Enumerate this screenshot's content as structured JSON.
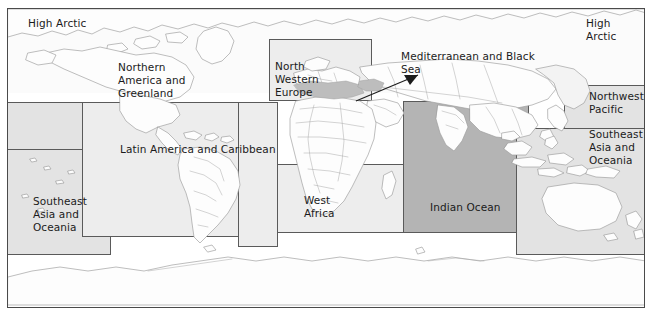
{
  "figure": {
    "kind": "world-regions-map",
    "width": 653,
    "height": 316,
    "frame": {
      "x": 7,
      "y": 8,
      "w": 638,
      "h": 300,
      "border_color": "#4a4a4a"
    }
  },
  "palette": {
    "background": "#ffffff",
    "frame_border": "#4a4a4a",
    "region_border": "#5a5a5a",
    "coastline": "#8d8d8d",
    "country_border": "#a9a9a9",
    "label_text": "#1b1b1b",
    "shade_near_white": "#fbfbfb",
    "shade_light": "#ededed",
    "shade_light_mid": "#e3e3e3",
    "shade_mid": "#c9c9c9",
    "shade_dark_mid": "#b4b4b4"
  },
  "regions": [
    {
      "id": "high-arctic",
      "label": "High Arctic",
      "label_lines": "High Arctic",
      "shade": "shade-0",
      "box": {
        "x": 0,
        "y": 0,
        "w": 637,
        "h": 84
      },
      "label_pos": {
        "x": 22,
        "y": 8
      },
      "note": "polar band spanning the entire top of the map"
    },
    {
      "id": "high-arctic-right-label",
      "label": "High Arctic",
      "label_lines": "High Arctic",
      "label_pos": {
        "x": 578,
        "y": 8
      },
      "label_only": true
    },
    {
      "id": "northern-america-and-greenland",
      "label": "Northern America and Greenland",
      "label_lines": "Northern\nAmerica and\nGreenland",
      "shade": "shade-0",
      "box": {
        "x": 73,
        "y": 84,
        "w": 195,
        "h": 10
      },
      "label_pos": {
        "x": 110,
        "y": 52
      }
    },
    {
      "id": "north-western-europe",
      "label": "North Western Europe",
      "label_lines": "North\nWestern\nEurope",
      "shade": "shade-1",
      "box": {
        "x": 261,
        "y": 30,
        "w": 103,
        "h": 62
      },
      "label_pos": {
        "x": 269,
        "y": 52
      }
    },
    {
      "id": "mediterranean-and-black-sea",
      "label": "Mediterranean and Black Sea",
      "label_lines": "Mediterranean and Black\nSea",
      "shade": "shade-3",
      "label_pos": {
        "x": 393,
        "y": 43
      },
      "arrow": {
        "from": {
          "x": 418,
          "y": 72
        },
        "to": {
          "x": 355,
          "y": 92
        }
      }
    },
    {
      "id": "northwest-pacific",
      "label": "Northwest Pacific",
      "label_lines": "Northwest\nPacific",
      "shade": "shade-2",
      "box": {
        "x": 556,
        "y": 76,
        "w": 81,
        "h": 44
      },
      "label_pos": {
        "x": 582,
        "y": 85
      }
    },
    {
      "id": "southeast-asia-and-oceania-east",
      "label": "Southeast Asia and Oceania",
      "label_lines": "Southeast\nAsia and\nOceania",
      "shade": "shade-2",
      "box": {
        "x": 508,
        "y": 120,
        "w": 129,
        "h": 126
      },
      "label_pos": {
        "x": 582,
        "y": 120
      }
    },
    {
      "id": "southeast-asia-and-oceania-west",
      "label": "Southeast Asia and Oceania",
      "label_lines": "Southeast\nAsia and\nOceania",
      "shade": "shade-2",
      "box": {
        "x": 0,
        "y": 93,
        "w": 103,
        "h": 153
      },
      "label_pos": {
        "x": 26,
        "y": 193
      }
    },
    {
      "id": "latin-america-and-caribbean",
      "label": "Latin America and Caribbean",
      "label_lines": "Latin America and Caribbean",
      "shade": "shade-1",
      "box": {
        "x": 73,
        "y": 93,
        "w": 196,
        "h": 135
      },
      "label_pos": {
        "x": 113,
        "y": 139
      }
    },
    {
      "id": "west-africa",
      "label": "West Africa",
      "label_lines": "West\nAfrica",
      "shade": "shade-1",
      "box": {
        "x": 269,
        "y": 155,
        "w": 126,
        "h": 69
      },
      "label_pos": {
        "x": 297,
        "y": 192
      }
    },
    {
      "id": "indian-ocean",
      "label": "Indian Ocean",
      "label_lines": "Indian Ocean",
      "shade": "shade-4",
      "box": {
        "x": 395,
        "y": 92,
        "w": 126,
        "h": 132
      },
      "label_pos": {
        "x": 424,
        "y": 198
      }
    }
  ],
  "labels": [
    {
      "name": "label-high-arctic-left",
      "text": "High Arctic"
    },
    {
      "name": "label-high-arctic-right",
      "text": "High Arctic"
    },
    {
      "name": "label-northern-america",
      "text": "Northern\nAmerica and\nGreenland"
    },
    {
      "name": "label-north-west-europe",
      "text": "North\nWestern\nEurope"
    },
    {
      "name": "label-mediterranean",
      "text": "Mediterranean and Black\nSea"
    },
    {
      "name": "label-northwest-pacific",
      "text": "Northwest\nPacific"
    },
    {
      "name": "label-sea-oceania-east",
      "text": "Southeast\nAsia and\nOceania"
    },
    {
      "name": "label-sea-oceania-west",
      "text": "Southeast\nAsia and\nOceania"
    },
    {
      "name": "label-latin-america",
      "text": "Latin America and Caribbean"
    },
    {
      "name": "label-west-africa",
      "text": "West\nAfrica"
    },
    {
      "name": "label-indian-ocean",
      "text": "Indian Ocean"
    }
  ]
}
